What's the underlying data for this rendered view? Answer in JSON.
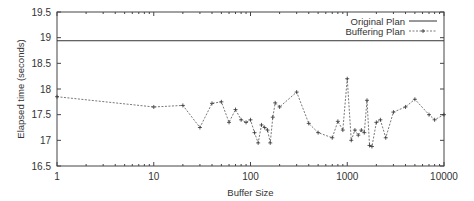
{
  "chart_data": {
    "type": "line",
    "title": "",
    "xlabel": "Buffer Size",
    "ylabel": "Elapsed time (seconds)",
    "xscale": "log",
    "xlim": [
      1,
      10000
    ],
    "ylim": [
      16.5,
      19.5
    ],
    "x_ticks": [
      "1",
      "10",
      "100",
      "1000",
      "10000"
    ],
    "y_ticks": [
      "16.5",
      "17",
      "17.5",
      "18",
      "18.5",
      "19",
      "19.5"
    ],
    "grid": false,
    "legend_position": "top-right",
    "series": [
      {
        "name": "Original Plan",
        "style": "solid",
        "x": [
          1,
          10000
        ],
        "values": [
          18.94,
          18.94
        ]
      },
      {
        "name": "Buffering Plan",
        "style": "dashed-plus",
        "x": [
          1,
          10,
          20,
          30,
          40,
          50,
          60,
          70,
          80,
          90,
          100,
          110,
          120,
          130,
          140,
          150,
          160,
          170,
          180,
          200,
          300,
          400,
          500,
          700,
          800,
          900,
          1000,
          1100,
          1200,
          1300,
          1400,
          1500,
          1600,
          1700,
          1800,
          2000,
          2200,
          2500,
          3000,
          4000,
          5000,
          7000,
          8000,
          10000
        ],
        "values": [
          17.85,
          17.65,
          17.68,
          17.25,
          17.72,
          17.75,
          17.35,
          17.6,
          17.4,
          17.35,
          17.4,
          17.15,
          16.95,
          17.3,
          17.25,
          17.2,
          16.95,
          17.45,
          17.73,
          17.65,
          17.94,
          17.33,
          17.15,
          17.05,
          17.37,
          17.2,
          18.2,
          17.0,
          17.2,
          17.1,
          17.2,
          17.15,
          17.78,
          16.9,
          16.88,
          17.35,
          17.4,
          17.05,
          17.55,
          17.65,
          17.8,
          17.5,
          17.4,
          17.5
        ]
      }
    ]
  }
}
